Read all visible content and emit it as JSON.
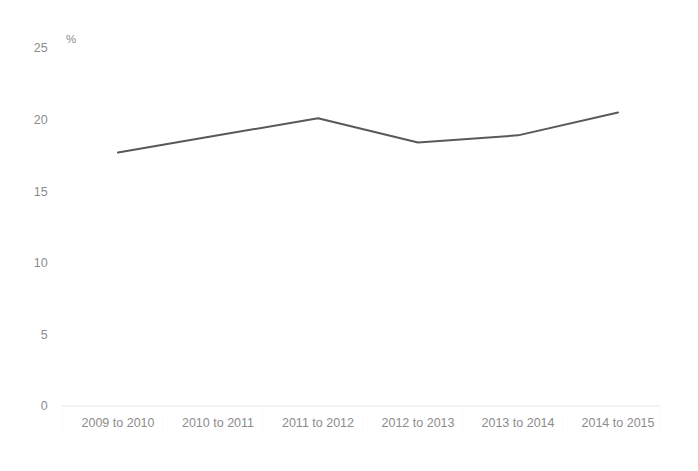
{
  "chart_data": {
    "type": "line",
    "title": "",
    "subtitle": "",
    "xlabel": "",
    "ylabel": "",
    "unit_label": "%",
    "categories": [
      "2009 to 2010",
      "2010 to 2011",
      "2011 to 2012",
      "2012 to 2013",
      "2013 to 2014",
      "2014 to 2015"
    ],
    "series": [
      {
        "name": "",
        "values": [
          17.7,
          18.9,
          20.1,
          18.4,
          18.9,
          20.5
        ],
        "color": "#595959"
      }
    ],
    "ylim": [
      0,
      25
    ],
    "yticks": [
      0,
      5,
      10,
      15,
      20,
      25
    ],
    "ytick_labels": [
      "0",
      "5",
      "10",
      "15",
      "20",
      "25"
    ],
    "grid": false,
    "legend": "none",
    "line_width": 2,
    "markers": false,
    "background_color": "#ffffff",
    "axis_color": "#f2f2f2",
    "tick_label_color": "#8c8c8c"
  }
}
